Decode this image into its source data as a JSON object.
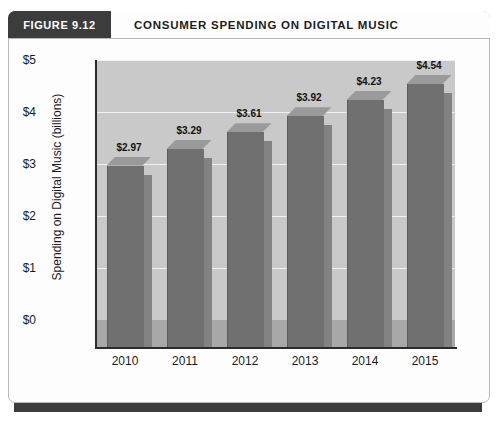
{
  "figure": {
    "tab_label": "FIGURE 9.12",
    "title": "CONSUMER SPENDING ON DIGITAL MUSIC"
  },
  "colors": {
    "tab_background": "#3c3c3c",
    "frame_border": "#b9b9b9",
    "plot_wall": "#c9c9c9",
    "plot_floor": "#a8a8a8",
    "bar_front": "#707070",
    "bar_side": "#828282",
    "bar_top": "#9a9a9a",
    "gridline": "#f0f0f0",
    "axis": "#2b2b2b",
    "bottom_rule": "#3c3c3c"
  },
  "chart_data": {
    "type": "bar",
    "title": "CONSUMER SPENDING ON DIGITAL MUSIC",
    "categories": [
      "2010",
      "2011",
      "2012",
      "2013",
      "2014",
      "2015"
    ],
    "values": [
      2.97,
      3.29,
      3.61,
      3.92,
      4.23,
      4.54
    ],
    "data_labels": [
      "$2.97",
      "$3.29",
      "$3.61",
      "$3.92",
      "$4.23",
      "$4.54"
    ],
    "xlabel": "",
    "ylabel": "Spending on Digital Music  (billions)",
    "ylim": [
      0,
      5
    ],
    "yticks": [
      0,
      1,
      2,
      3,
      4,
      5
    ],
    "ytick_labels": [
      "$0",
      "$1",
      "$2",
      "$3",
      "$4",
      "$5"
    ],
    "grid": true,
    "grid_axis": "y",
    "legend": false,
    "three_d": true
  }
}
